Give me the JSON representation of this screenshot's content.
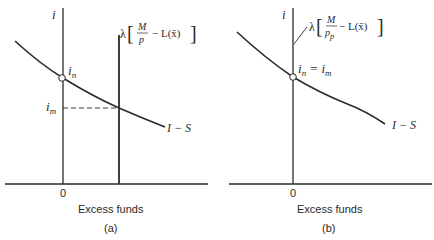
{
  "panels": [
    {
      "id": "a",
      "caption": "(a)",
      "y_axis_label": "i",
      "x_axis_label": "Excess funds",
      "origin_label": "0",
      "curve_label": "I − S",
      "point_label_main": "i",
      "point_label_sub": "n",
      "level_label_main": "i",
      "level_label_sub": "m",
      "supply_line_label": {
        "lambda": "λ",
        "numerator": "M",
        "denominator": "p",
        "rest": "− L(x̄)"
      }
    },
    {
      "id": "b",
      "caption": "(b)",
      "y_axis_label": "i",
      "x_axis_label": "Excess funds",
      "origin_label": "0",
      "curve_label": "I − S",
      "point_label": "i_n = i_m",
      "point_label_parts": {
        "a": "i",
        "a_sub": "n",
        "eq": "=",
        "b": "i",
        "b_sub": "m"
      },
      "supply_line_label": {
        "lambda": "λ",
        "numerator": "M",
        "denominator": "p",
        "denominator_sub": "p",
        "rest": "− L(x̄)"
      }
    }
  ]
}
